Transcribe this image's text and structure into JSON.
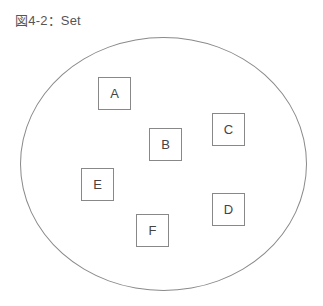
{
  "figure": {
    "title": "図4-2：Set"
  },
  "set": {
    "elements": [
      {
        "label": "A",
        "x": 98,
        "y": 77
      },
      {
        "label": "B",
        "x": 149,
        "y": 128
      },
      {
        "label": "C",
        "x": 212,
        "y": 113
      },
      {
        "label": "D",
        "x": 212,
        "y": 193
      },
      {
        "label": "E",
        "x": 81,
        "y": 168
      },
      {
        "label": "F",
        "x": 136,
        "y": 214
      }
    ]
  }
}
